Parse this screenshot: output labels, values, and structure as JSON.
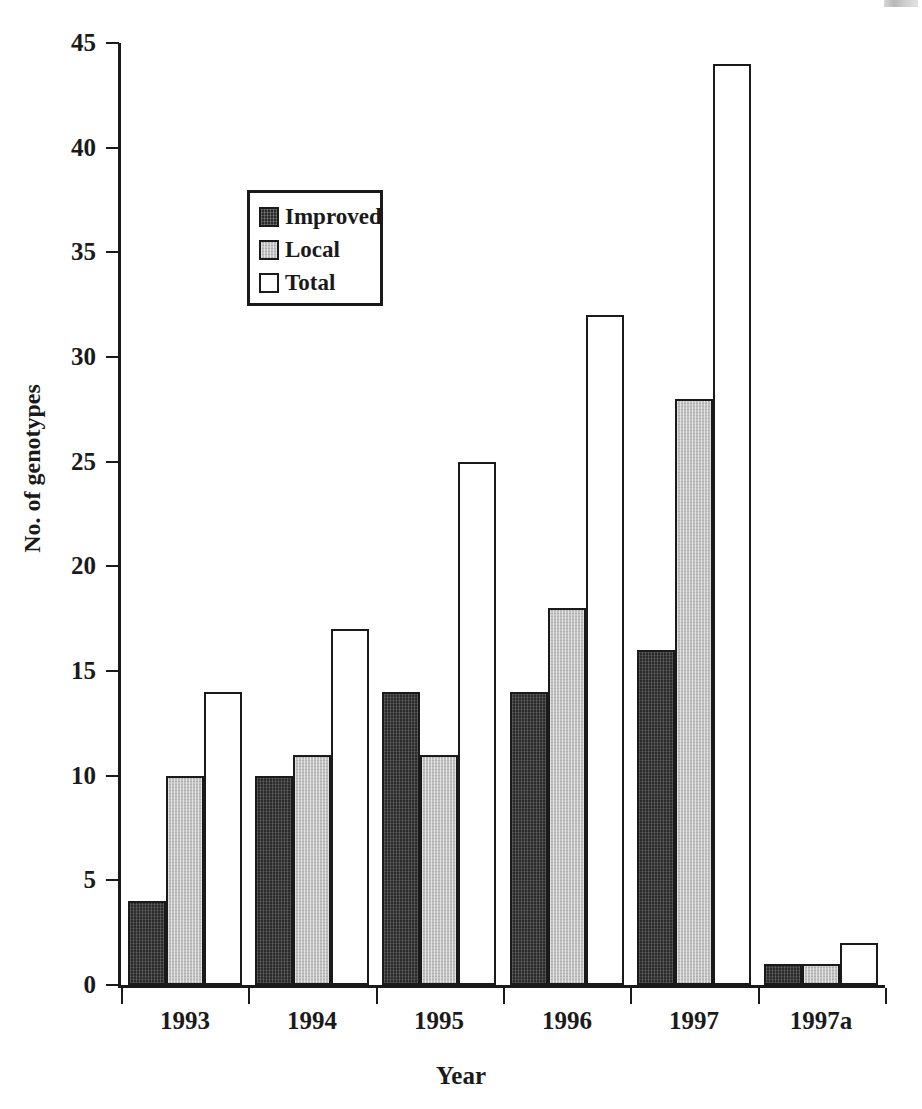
{
  "chart_data": {
    "type": "bar",
    "title": "",
    "xlabel": "Year",
    "ylabel": "No. of genotypes",
    "categories": [
      "1993",
      "1994",
      "1995",
      "1996",
      "1997",
      "1997a"
    ],
    "series": [
      {
        "name": "Improved",
        "values": [
          4,
          10,
          14,
          14,
          16,
          1
        ],
        "color": "#2b2b2b"
      },
      {
        "name": "Local",
        "values": [
          10,
          11,
          11,
          18,
          28,
          1
        ],
        "color": "#c2c2c2"
      },
      {
        "name": "Total",
        "values": [
          14,
          17,
          25,
          32,
          44,
          2
        ],
        "color": "#ffffff"
      }
    ],
    "ylim": [
      0,
      45
    ],
    "ytick_labels": [
      "0",
      "5",
      "10",
      "15",
      "20",
      "25",
      "30",
      "35",
      "40",
      "45"
    ],
    "ytick_values": [
      0,
      5,
      10,
      15,
      20,
      25,
      30,
      35,
      40,
      45
    ],
    "grid": false,
    "legend_position": "upper-left-inside",
    "legend_entries": [
      "Improved",
      "Local",
      "Total"
    ]
  },
  "axes": {
    "y_title": "No. of genotypes",
    "x_title": "Year"
  },
  "legend": {
    "items": [
      {
        "label": "Improved",
        "swatch": "dark-hatched-swatch"
      },
      {
        "label": "Local",
        "swatch": "gray-hatched-swatch"
      },
      {
        "label": "Total",
        "swatch": "white-outline-swatch"
      }
    ]
  }
}
